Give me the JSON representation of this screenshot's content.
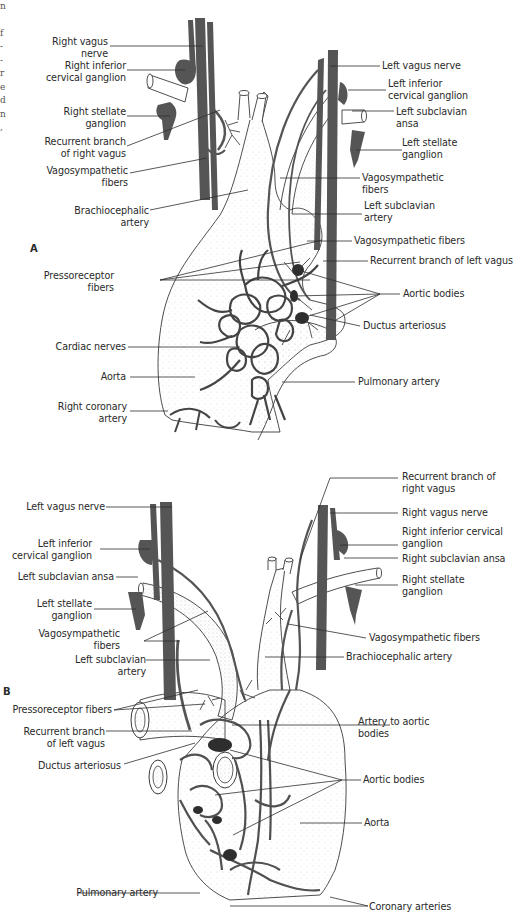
{
  "figure": {
    "edge_text_fragments": [
      "n",
      "",
      "f",
      "-",
      "-",
      "r",
      "e",
      "d",
      "n",
      ","
    ],
    "colors": {
      "nerve": "#555555",
      "outline": "#3a3a3a",
      "stipple": "#9a9a9a",
      "background": "#ffffff",
      "text": "#2a2a2a"
    },
    "panel_a": {
      "letter": "A",
      "labels": [
        {
          "id": "right-vagus-nerve",
          "lines": [
            "Right vagus",
            "nerve"
          ]
        },
        {
          "id": "right-inferior-cervical-ganglion",
          "lines": [
            "Right inferior",
            "cervical ganglion"
          ]
        },
        {
          "id": "right-stellate-ganglion",
          "lines": [
            "Right stellate",
            "ganglion"
          ]
        },
        {
          "id": "recurrent-branch-right-vagus",
          "lines": [
            "Recurrent branch",
            "of right vagus"
          ]
        },
        {
          "id": "vagosympathetic-fibers-right",
          "lines": [
            "Vagosympathetic",
            "fibers"
          ]
        },
        {
          "id": "brachiocephalic-artery",
          "lines": [
            "Brachiocephalic",
            "artery"
          ]
        },
        {
          "id": "pressoreceptor-fibers",
          "lines": [
            "Pressoreceptor",
            "fibers"
          ]
        },
        {
          "id": "cardiac-nerves",
          "lines": [
            "Cardiac nerves"
          ]
        },
        {
          "id": "aorta",
          "lines": [
            "Aorta"
          ]
        },
        {
          "id": "right-coronary-artery",
          "lines": [
            "Right coronary",
            "artery"
          ]
        },
        {
          "id": "left-vagus-nerve",
          "lines": [
            "Left vagus nerve"
          ]
        },
        {
          "id": "left-inferior-cervical-ganglion",
          "lines": [
            "Left inferior",
            "cervical ganglion"
          ]
        },
        {
          "id": "left-subclavian-ansa",
          "lines": [
            "Left subclavian",
            "ansa"
          ]
        },
        {
          "id": "left-stellate-ganglion",
          "lines": [
            "Left stellate",
            "ganglion"
          ]
        },
        {
          "id": "vagosympathetic-fibers-left",
          "lines": [
            "Vagosympathetic",
            "fibers"
          ]
        },
        {
          "id": "left-subclavian-artery",
          "lines": [
            "Left subclavian",
            "artery"
          ]
        },
        {
          "id": "vagosympathetic-fibers-center",
          "lines": [
            "Vagosympathetic fibers"
          ]
        },
        {
          "id": "recurrent-branch-left-vagus",
          "lines": [
            "Recurrent branch of left vagus"
          ]
        },
        {
          "id": "aortic-bodies",
          "lines": [
            "Aortic bodies"
          ]
        },
        {
          "id": "ductus-arteriosus",
          "lines": [
            "Ductus arteriosus"
          ]
        },
        {
          "id": "pulmonary-artery",
          "lines": [
            "Pulmonary artery"
          ]
        }
      ]
    },
    "panel_b": {
      "letter": "B",
      "labels": [
        {
          "id": "left-vagus-nerve",
          "lines": [
            "Left vagus nerve"
          ]
        },
        {
          "id": "left-inferior-cervical-ganglion",
          "lines": [
            "Left inferior",
            "cervical ganglion"
          ]
        },
        {
          "id": "left-subclavian-ansa",
          "lines": [
            "Left subclavian ansa"
          ]
        },
        {
          "id": "left-stellate-ganglion",
          "lines": [
            "Left stellate",
            "ganglion"
          ]
        },
        {
          "id": "vagosympathetic-fibers-left",
          "lines": [
            "Vagosympathetic",
            "fibers"
          ]
        },
        {
          "id": "left-subclavian-artery",
          "lines": [
            "Left subclavian",
            "artery"
          ]
        },
        {
          "id": "pressoreceptor-fibers",
          "lines": [
            "Pressoreceptor fibers"
          ]
        },
        {
          "id": "recurrent-branch-left-vagus",
          "lines": [
            "Recurrent branch",
            "of left vagus"
          ]
        },
        {
          "id": "ductus-arteriosus",
          "lines": [
            "Ductus arteriosus"
          ]
        },
        {
          "id": "pulmonary-artery",
          "lines": [
            "Pulmonary artery"
          ]
        },
        {
          "id": "recurrent-branch-right-vagus",
          "lines": [
            "Recurrent branch of",
            "right vagus"
          ]
        },
        {
          "id": "right-vagus-nerve",
          "lines": [
            "Right vagus nerve"
          ]
        },
        {
          "id": "right-inferior-cervical-ganglion",
          "lines": [
            "Right inferior cervical",
            "ganglion"
          ]
        },
        {
          "id": "right-subclavian-ansa",
          "lines": [
            "Right subclavian ansa"
          ]
        },
        {
          "id": "right-stellate-ganglion",
          "lines": [
            "Right stellate",
            "ganglion"
          ]
        },
        {
          "id": "vagosympathetic-fibers-right",
          "lines": [
            "Vagosympathetic fibers"
          ]
        },
        {
          "id": "brachiocephalic-artery",
          "lines": [
            "Brachiocephalic artery"
          ]
        },
        {
          "id": "artery-to-aortic-bodies",
          "lines": [
            "Artery to aortic",
            "bodies"
          ]
        },
        {
          "id": "aortic-bodies",
          "lines": [
            "Aortic bodies"
          ]
        },
        {
          "id": "aorta",
          "lines": [
            "Aorta"
          ]
        },
        {
          "id": "coronary-arteries",
          "lines": [
            "Coronary arteries"
          ]
        }
      ]
    }
  }
}
